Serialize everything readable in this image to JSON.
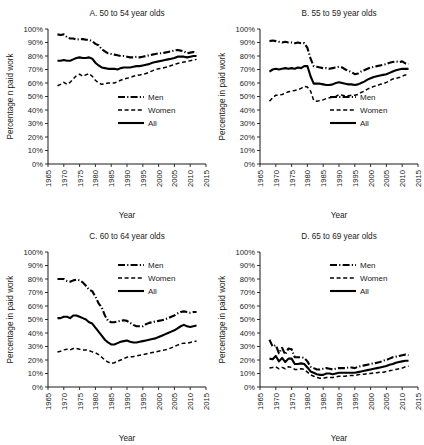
{
  "figure": {
    "panel_order": [
      "A",
      "B",
      "C",
      "D"
    ]
  },
  "axis": {
    "ylabel_a": "Percentage n paid work",
    "ylabel_b": "Percentage in paid work",
    "ylabel_c": "Percentage in paid work",
    "ylabel_d": "Percentage in paid work",
    "xlabel": "Year",
    "yticks": [
      "0%",
      "10%",
      "20%",
      "30%",
      "40%",
      "50%",
      "60%",
      "70%",
      "80%",
      "90%",
      "100%"
    ],
    "xticks": [
      "1965",
      "1970",
      "1975",
      "1980",
      "1985",
      "1990",
      "1995",
      "2000",
      "2005",
      "2010",
      "2015"
    ]
  },
  "legend": {
    "men": "Men",
    "women": "Women",
    "all": "All"
  },
  "chart_data": [
    {
      "id": "A",
      "type": "line",
      "title": "A.  50 to 54 year olds",
      "xlabel": "Year",
      "ylabel": "Percentage n paid work",
      "xlim": [
        1965,
        2015
      ],
      "ylim": [
        0,
        100
      ],
      "grid": false,
      "legend_position": "center-right",
      "x": [
        1968,
        1969,
        1970,
        1971,
        1972,
        1973,
        1974,
        1975,
        1976,
        1977,
        1978,
        1979,
        1980,
        1981,
        1982,
        1983,
        1984,
        1985,
        1986,
        1987,
        1988,
        1989,
        1990,
        1991,
        1992,
        1993,
        1994,
        1995,
        1996,
        1997,
        1998,
        1999,
        2000,
        2001,
        2002,
        2003,
        2004,
        2005,
        2006,
        2007,
        2008,
        2009,
        2010,
        2011,
        2012
      ],
      "series": [
        {
          "name": "Men",
          "style": "dashdot",
          "values": [
            96,
            95.5,
            96,
            94,
            93,
            93,
            92,
            92.5,
            92.5,
            92,
            92,
            91,
            89,
            88,
            85,
            83.5,
            82,
            81.5,
            81,
            80.5,
            80,
            80,
            79.5,
            79,
            79,
            79.5,
            79,
            79.5,
            80,
            80.5,
            81,
            81.5,
            82,
            82,
            82.5,
            83,
            83.5,
            84,
            84.5,
            84,
            83.5,
            82,
            82.5,
            83,
            82.5
          ]
        },
        {
          "name": "Women",
          "style": "dashed",
          "values": [
            58,
            59,
            60.5,
            59,
            60.5,
            63,
            65.5,
            66.5,
            65,
            66,
            67,
            65,
            62,
            60,
            59,
            59.5,
            60,
            60,
            60,
            61,
            62,
            63,
            63.5,
            64,
            65,
            65.5,
            66,
            66.5,
            67,
            68,
            69,
            70,
            70.5,
            71,
            71.5,
            72,
            73,
            73.5,
            74.5,
            75,
            75.5,
            76,
            76.5,
            77,
            77.5
          ]
        },
        {
          "name": "All",
          "style": "solid",
          "values": [
            76.5,
            76.5,
            77,
            76.5,
            76.5,
            77.5,
            78.5,
            79,
            78.5,
            78.5,
            79,
            78,
            75,
            73,
            71.5,
            71,
            70.5,
            70.5,
            70.5,
            70,
            71,
            71.5,
            71.5,
            71.5,
            72,
            72.5,
            72.5,
            73,
            73.5,
            74,
            75,
            75.5,
            76,
            76.5,
            77,
            77.5,
            78,
            78.5,
            79.5,
            79.5,
            79.5,
            79,
            79.5,
            80,
            80
          ]
        }
      ]
    },
    {
      "id": "B",
      "type": "line",
      "title": "B.  55 to 59 year olds",
      "xlabel": "Year",
      "ylabel": "Percentage in paid work",
      "xlim": [
        1965,
        2015
      ],
      "ylim": [
        0,
        100
      ],
      "grid": false,
      "legend_position": "center-right",
      "x": [
        1968,
        1969,
        1970,
        1971,
        1972,
        1973,
        1974,
        1975,
        1976,
        1977,
        1978,
        1979,
        1980,
        1981,
        1982,
        1983,
        1984,
        1985,
        1986,
        1987,
        1988,
        1989,
        1990,
        1991,
        1992,
        1993,
        1994,
        1995,
        1996,
        1997,
        1998,
        1999,
        2000,
        2001,
        2002,
        2003,
        2004,
        2005,
        2006,
        2007,
        2008,
        2009,
        2010,
        2011,
        2012
      ],
      "series": [
        {
          "name": "Men",
          "style": "dashdot",
          "values": [
            91,
            91.5,
            91,
            90.5,
            90,
            90.5,
            90,
            90,
            89.5,
            90,
            89.5,
            89.5,
            86,
            78,
            72.5,
            72,
            71.5,
            71,
            71,
            70.5,
            71,
            71.5,
            72,
            71.5,
            70,
            69,
            68,
            66.5,
            67,
            68.5,
            69.5,
            70.5,
            71.5,
            72,
            72.5,
            73,
            73.5,
            74,
            75,
            75.5,
            76,
            75.5,
            76,
            74.5,
            74
          ]
        },
        {
          "name": "Women",
          "style": "dashed",
          "values": [
            46.5,
            49,
            51,
            51,
            51.5,
            52.5,
            53.5,
            54,
            54.5,
            55,
            56,
            57.5,
            57,
            54,
            47,
            46.5,
            47,
            47.5,
            48.5,
            49,
            49.5,
            50,
            51.5,
            51,
            50.5,
            50.5,
            51,
            51,
            51.5,
            53,
            54,
            55.5,
            56.5,
            57.5,
            58,
            59,
            59.5,
            60.5,
            61.5,
            63,
            63.5,
            64,
            65,
            66,
            65
          ]
        },
        {
          "name": "All",
          "style": "solid",
          "values": [
            68.5,
            70,
            70.5,
            70,
            70.5,
            71,
            70.5,
            71,
            70.5,
            71.5,
            71,
            72.5,
            72.5,
            65,
            59.5,
            59.5,
            59.5,
            59,
            58.5,
            58.5,
            59,
            60,
            60.5,
            60,
            59.5,
            59,
            59,
            58.5,
            59,
            60,
            61,
            62.5,
            63.5,
            64.5,
            65,
            65.5,
            66,
            66.5,
            67.5,
            68.5,
            69.5,
            70,
            70.5,
            70.5,
            70.5
          ]
        }
      ]
    },
    {
      "id": "C",
      "type": "line",
      "title": "C.  60 to 64 year olds",
      "xlabel": "Year",
      "ylabel": "Percentage in paid work",
      "xlim": [
        1965,
        2015
      ],
      "ylim": [
        0,
        100
      ],
      "grid": false,
      "legend_position": "top-right",
      "x": [
        1968,
        1969,
        1970,
        1971,
        1972,
        1973,
        1974,
        1975,
        1976,
        1977,
        1978,
        1979,
        1980,
        1981,
        1982,
        1983,
        1984,
        1985,
        1986,
        1987,
        1988,
        1989,
        1990,
        1991,
        1992,
        1993,
        1994,
        1995,
        1996,
        1997,
        1998,
        1999,
        2000,
        2001,
        2002,
        2003,
        2004,
        2005,
        2006,
        2007,
        2008,
        2009,
        2010,
        2011,
        2012
      ],
      "series": [
        {
          "name": "Men",
          "style": "dashdot",
          "values": [
            80,
            80,
            80,
            78.5,
            78,
            79,
            79.5,
            79,
            77.5,
            75,
            72,
            71,
            67,
            62,
            59,
            53,
            49,
            48,
            48,
            48.5,
            49,
            49.5,
            49,
            47.5,
            46,
            45,
            45,
            45,
            46.5,
            47.5,
            48,
            48.5,
            49,
            49.5,
            50,
            51,
            52,
            53,
            54.5,
            55.5,
            56,
            55.5,
            55,
            55.5,
            55.5
          ]
        },
        {
          "name": "Women",
          "style": "dashed",
          "values": [
            26,
            26.5,
            27.5,
            28,
            27.5,
            28.5,
            28.5,
            28,
            27.5,
            27.5,
            27,
            26,
            25.5,
            24,
            22,
            20,
            18.5,
            17.5,
            18,
            19,
            20,
            21,
            22,
            22.5,
            22.5,
            23,
            23.5,
            24,
            24.5,
            25,
            25.5,
            26,
            26.5,
            27,
            27.5,
            28,
            29,
            30,
            31,
            32,
            32.5,
            32.5,
            33,
            33.5,
            34
          ]
        },
        {
          "name": "All",
          "style": "solid",
          "values": [
            51,
            51,
            52,
            52,
            51,
            53,
            53,
            52,
            51,
            50,
            48,
            47,
            44,
            41,
            38,
            35,
            33,
            31.5,
            31.5,
            32.5,
            33.5,
            34,
            34.5,
            33.5,
            33,
            33,
            33.5,
            34,
            34.5,
            35,
            35.5,
            36,
            37,
            38,
            39,
            40,
            41,
            42,
            43.5,
            45,
            46,
            45,
            44.5,
            45,
            45.5
          ]
        }
      ]
    },
    {
      "id": "D",
      "type": "line",
      "title": "D.  65 to 69 year olds",
      "xlabel": "Year",
      "ylabel": "Percentage in paid work",
      "xlim": [
        1965,
        2015
      ],
      "ylim": [
        0,
        100
      ],
      "grid": false,
      "legend_position": "top-right",
      "x": [
        1968,
        1969,
        1970,
        1971,
        1972,
        1973,
        1974,
        1975,
        1976,
        1977,
        1978,
        1979,
        1980,
        1981,
        1982,
        1983,
        1984,
        1985,
        1986,
        1987,
        1988,
        1989,
        1990,
        1991,
        1992,
        1993,
        1994,
        1995,
        1996,
        1997,
        1998,
        1999,
        2000,
        2001,
        2002,
        2003,
        2004,
        2005,
        2006,
        2007,
        2008,
        2009,
        2010,
        2011,
        2012
      ],
      "series": [
        {
          "name": "Men",
          "style": "dashdot",
          "values": [
            35,
            30,
            31,
            25,
            29,
            24,
            28.5,
            28,
            22,
            22,
            22,
            21.5,
            19,
            15,
            14,
            13,
            13,
            13.5,
            14,
            13.5,
            13,
            13.5,
            14,
            14,
            14,
            14.5,
            14.5,
            14,
            15,
            15.5,
            16,
            16.5,
            17,
            17.5,
            18,
            18.5,
            19.5,
            20,
            21,
            22,
            22.5,
            23,
            23.5,
            24,
            23.5
          ]
        },
        {
          "name": "Women",
          "style": "dashed",
          "values": [
            14,
            14.5,
            15,
            13.5,
            14.5,
            13.5,
            15,
            14.5,
            13,
            13,
            13.5,
            13,
            11,
            9,
            8,
            7,
            6.5,
            6.5,
            7,
            7,
            7,
            7.5,
            8,
            8,
            8,
            8.5,
            8.5,
            8.5,
            9,
            9.5,
            9.5,
            10,
            10,
            10.5,
            10.5,
            11,
            11,
            11.5,
            12,
            12.5,
            13,
            13.5,
            14,
            15,
            15.5
          ]
        },
        {
          "name": "All",
          "style": "solid",
          "values": [
            21,
            20.5,
            23,
            19,
            21.5,
            18.5,
            21,
            21,
            17,
            17,
            17.5,
            17,
            14.5,
            11.5,
            10.5,
            9.5,
            9,
            9,
            10,
            10,
            9.5,
            10,
            10.5,
            10.5,
            10.5,
            10.5,
            10.5,
            10.5,
            11,
            11.5,
            12,
            12.5,
            13,
            13.5,
            14,
            14.5,
            15,
            15.5,
            16.5,
            17,
            18,
            18.5,
            19,
            19.5,
            19.5
          ]
        }
      ]
    }
  ]
}
